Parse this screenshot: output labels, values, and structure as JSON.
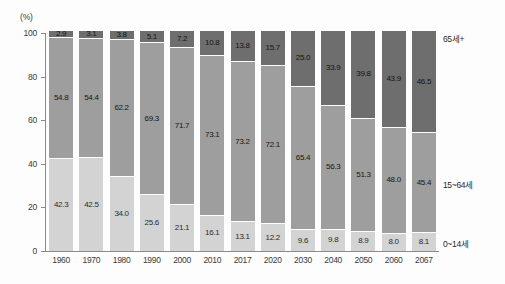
{
  "chart_data": {
    "type": "bar",
    "subtype": "stacked-percentage",
    "title": "",
    "subtitle": "",
    "unit_label": "(%)",
    "xlabel": "",
    "ylabel": "",
    "ylim": [
      0,
      100
    ],
    "yticks": [
      0,
      20,
      40,
      60,
      80,
      100
    ],
    "ytick_labels": [
      "0",
      "20",
      "40",
      "60",
      "80",
      "100"
    ],
    "grid": false,
    "legend_position": "right",
    "categories": [
      "1960",
      "1970",
      "1980",
      "1990",
      "2000",
      "2010",
      "2017",
      "2020",
      "2030",
      "2040",
      "2050",
      "2060",
      "2067"
    ],
    "series": [
      {
        "name": "0~14세",
        "color": "#d3d3d3",
        "values": [
          42.3,
          42.5,
          34.0,
          25.6,
          21.1,
          16.1,
          13.1,
          12.2,
          9.6,
          9.8,
          8.9,
          8.0,
          8.1
        ],
        "labels": [
          "42.3",
          "42.5",
          "34.0",
          "25.6",
          "21.1",
          "16.1",
          "13.1",
          "12.2",
          "9.6",
          "9.8",
          "8.9",
          "8.0",
          "8.1"
        ]
      },
      {
        "name": "15~64세",
        "color": "#9e9e9e",
        "values": [
          54.8,
          54.4,
          62.2,
          69.3,
          71.7,
          73.1,
          73.2,
          72.1,
          65.4,
          56.3,
          51.3,
          48.0,
          45.4
        ],
        "labels": [
          "54.8",
          "54.4",
          "62.2",
          "69.3",
          "71.7",
          "73.1",
          "73.2",
          "72.1",
          "65.4",
          "56.3",
          "51.3",
          "48.0",
          "45.4"
        ]
      },
      {
        "name": "65세+",
        "color": "#6e6e6e",
        "values": [
          2.9,
          3.1,
          3.8,
          5.1,
          7.2,
          10.8,
          13.8,
          15.7,
          25.0,
          33.9,
          39.8,
          43.9,
          46.5
        ],
        "labels": [
          "2.9",
          "3.1",
          "3.8",
          "5.1",
          "7.2",
          "10.8",
          "13.8",
          "15.7",
          "25.0",
          "33.9",
          "39.8",
          "43.9",
          "46.5"
        ]
      }
    ],
    "series_right_labels": [
      {
        "text": "65세+",
        "series": "65세+"
      },
      {
        "text": "15~64세",
        "series": "15~64세"
      },
      {
        "text": "0~14세",
        "series": "0~14세"
      }
    ]
  },
  "colors": {
    "young": "#d3d3d3",
    "working": "#9e9e9e",
    "old": "#6e6e6e",
    "axis": "#8a8a8a",
    "text": "#2a2a2a",
    "background": "#fdfdfd"
  }
}
